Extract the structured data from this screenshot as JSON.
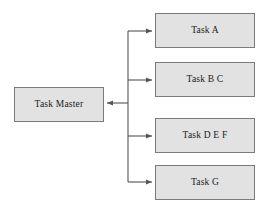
{
  "diagram": {
    "type": "flowchart",
    "background_color": "#ffffff",
    "node_fill_color": "#e2e2e2",
    "node_border_color": "#7a7a7a",
    "edge_color": "#555555",
    "text_color": "#1a1a1a",
    "root": {
      "id": "task-master",
      "label": "Task Master",
      "x": 14,
      "y": 87,
      "width": 90,
      "height": 35
    },
    "children": [
      {
        "id": "task-a",
        "label": "Task A",
        "x": 155,
        "y": 13,
        "width": 100,
        "height": 35
      },
      {
        "id": "task-b-c",
        "label": "Task B C",
        "x": 155,
        "y": 62,
        "width": 100,
        "height": 35
      },
      {
        "id": "task-d-e-f",
        "label": "Task D E F",
        "x": 155,
        "y": 118,
        "width": 100,
        "height": 35
      },
      {
        "id": "task-g",
        "label": "Task G",
        "x": 155,
        "y": 165,
        "width": 100,
        "height": 35
      }
    ],
    "connectors": {
      "trunk_x": 128,
      "trunk_top_y": 31,
      "trunk_bottom_y": 182,
      "branch_y_values": [
        31,
        80,
        136,
        182
      ],
      "branch_target_x": 153,
      "root_branch_y": 103,
      "root_target_x": 106,
      "arrow_direction_children": "right",
      "arrow_direction_root": "left"
    }
  }
}
